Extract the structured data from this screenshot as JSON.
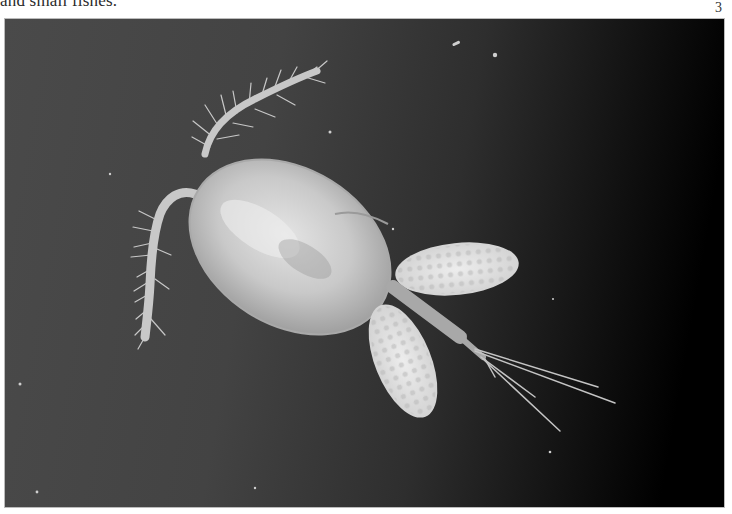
{
  "page": {
    "caption_fragment": "and small fishes.",
    "page_number": "3"
  },
  "figure": {
    "colors": {
      "background_left": "#4a4a4a",
      "background_right": "#000000",
      "body": "#cfcfcf",
      "egg_sac": "#e6e6e6"
    }
  }
}
